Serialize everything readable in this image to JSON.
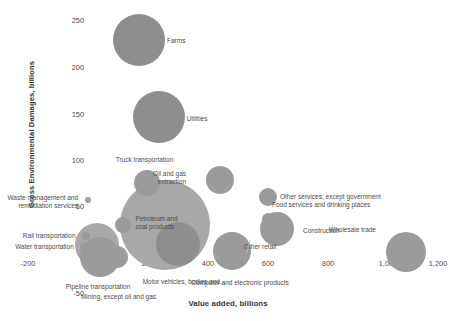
{
  "chart_data": {
    "type": "scatter",
    "title": "",
    "xlabel": "Value added, billions",
    "ylabel": "Gross Environmental Damages, billions",
    "xlim": [
      -200,
      1200
    ],
    "ylim": [
      -50,
      250
    ],
    "xticks": [
      "-200",
      "0",
      "200",
      "400",
      "600",
      "800",
      "1,000",
      "1,200"
    ],
    "xtick_values": [
      -200,
      0,
      200,
      400,
      600,
      800,
      1000,
      1200
    ],
    "yticks": [
      "250",
      "200",
      "150",
      "100",
      "50",
      "0",
      "-50"
    ],
    "ytick_values": [
      250,
      200,
      150,
      100,
      50,
      0,
      -50
    ],
    "grid": false,
    "legend": false,
    "bubble_color": "#9b9b9b",
    "points": [
      {
        "label": "Farms",
        "x": 170,
        "y": 227,
        "r": 26,
        "label_dx": 28,
        "label_dy": 1,
        "align": "left"
      },
      {
        "label": "Utilities",
        "x": 235,
        "y": 145,
        "r": 26,
        "label_dx": 28,
        "label_dy": 2,
        "align": "left"
      },
      {
        "label": "Truck transportation",
        "x": 195,
        "y": 75,
        "r": 13,
        "label_dx": -2,
        "label_dy": -23,
        "align": "center"
      },
      {
        "label": "Oil and gas\nextraction",
        "x": 440,
        "y": 78,
        "r": 14,
        "label_dx": -34,
        "label_dy": -6,
        "align": "right"
      },
      {
        "label": "Other services, except government",
        "x": 600,
        "y": 60,
        "r": 9,
        "label_dx": 12,
        "label_dy": 0,
        "align": "left"
      },
      {
        "label": "Waste management and\nremediation services",
        "x": 0,
        "y": 56,
        "r": 3,
        "label_dx": -10,
        "label_dy": -2,
        "align": "right"
      },
      {
        "label": "Petroleum and\ncoal products",
        "x": 118,
        "y": 30,
        "r": 8,
        "label_dx": 12,
        "label_dy": -6,
        "align": "left"
      },
      {
        "label": "Food services and drinking places",
        "x": 600,
        "y": 36,
        "r": 6,
        "label_dx": 4,
        "label_dy": -14,
        "align": "left"
      },
      {
        "label": "Construction",
        "x": 630,
        "y": 26,
        "r": 17,
        "label_dx": 26,
        "label_dy": 2,
        "align": "left"
      },
      {
        "label": "Rail transportation",
        "x": -8,
        "y": 18,
        "r": 4,
        "label_dx": -10,
        "label_dy": 0,
        "align": "right"
      },
      {
        "label": "Water transportation",
        "x": -14,
        "y": 6,
        "r": 4,
        "label_dx": -10,
        "label_dy": 0,
        "align": "right"
      },
      {
        "label": "Wholesale trade",
        "x": 1060,
        "y": 1,
        "r": 20,
        "label_dx": -30,
        "label_dy": -22,
        "align": "right"
      },
      {
        "label": "Pipeline transportation",
        "x": 40,
        "y": -4,
        "r": 20,
        "label_dx": -2,
        "label_dy": 30,
        "align": "center"
      },
      {
        "label": "Mining, except oil and gas",
        "x": 95,
        "y": -4,
        "r": 11,
        "label_dx": 2,
        "label_dy": 40,
        "align": "center"
      },
      {
        "label": "Motor vehicles, bodies and...",
        "x": 300,
        "y": 10,
        "r": 22,
        "label_dx": 6,
        "label_dy": 38,
        "align": "center"
      },
      {
        "label": "Computer and electronic products",
        "x": 480,
        "y": 2,
        "r": 19,
        "label_dx": 8,
        "label_dy": 32,
        "align": "center"
      },
      {
        "label": "Other retail",
        "x": 520,
        "y": 6,
        "r": 2,
        "label_dx": 0,
        "label_dy": 0,
        "align": "left"
      }
    ],
    "big_bubbles": [
      {
        "name": "large-mid-cluster",
        "x": 255,
        "y": 30,
        "r": 45
      },
      {
        "name": "origin-cluster",
        "x": 30,
        "y": 8,
        "r": 22
      }
    ]
  }
}
